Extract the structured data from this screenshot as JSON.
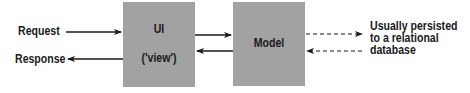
{
  "diagram": {
    "left_labels": {
      "request": "Request",
      "response": "Response"
    },
    "boxes": [
      {
        "id": "ui",
        "title": "UI",
        "subtitle": "('view')"
      },
      {
        "id": "model",
        "title": "Model"
      }
    ],
    "note": {
      "line1": "Usually persisted",
      "line2": "to a relational",
      "line3": "database"
    },
    "colors": {
      "box_fill": "#a2a2a2",
      "arrow": "#1a1a1a",
      "background": "#ffffff"
    },
    "edges": [
      {
        "from": "Request",
        "to": "UI",
        "style": "solid"
      },
      {
        "from": "UI",
        "to": "Response",
        "style": "solid"
      },
      {
        "from": "UI",
        "to": "Model",
        "style": "solid"
      },
      {
        "from": "Model",
        "to": "UI",
        "style": "solid"
      },
      {
        "from": "Model",
        "to": "database",
        "style": "dashed"
      },
      {
        "from": "database",
        "to": "Model",
        "style": "dashed"
      }
    ]
  }
}
